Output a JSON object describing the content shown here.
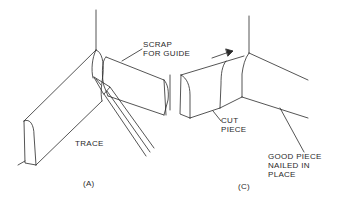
{
  "figure": {
    "panels": [
      {
        "id": "A",
        "caption": "(A)",
        "labels": {
          "scrap": "SCRAP\nFOR GUIDE",
          "trace": "TRACE"
        }
      },
      {
        "id": "C",
        "caption": "(C)",
        "labels": {
          "cut_piece": "CUT\nPIECE",
          "good_piece": "GOOD PIECE\nNAILED IN\nPLACE"
        }
      }
    ],
    "colors": {
      "line": "#2a2a2a",
      "background": "#ffffff"
    }
  }
}
